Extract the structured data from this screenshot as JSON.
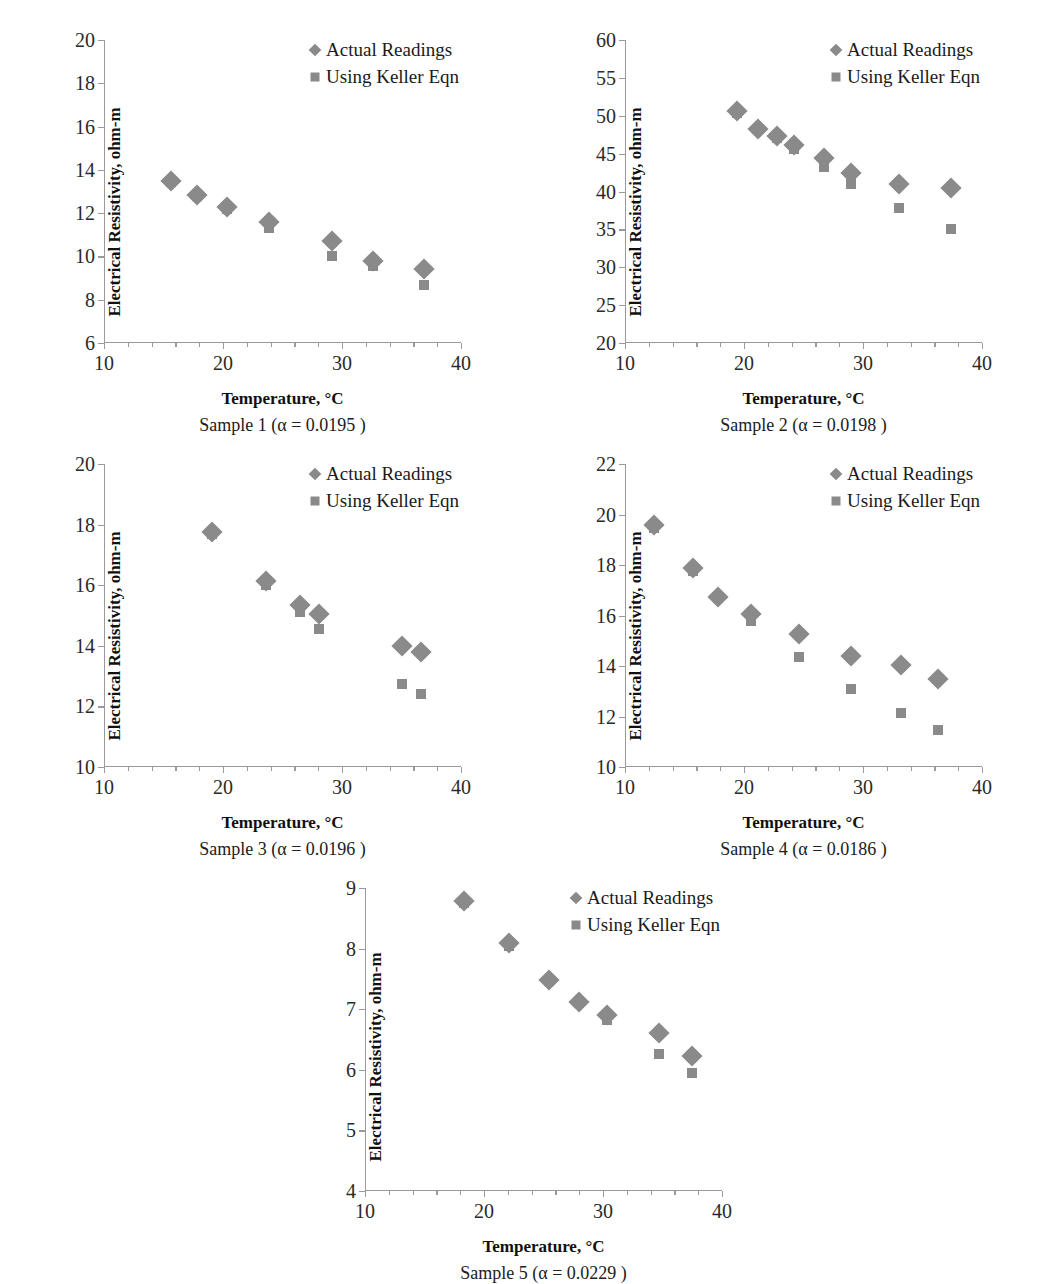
{
  "figure": {
    "layout": "2x2 grid plus one centered bottom panel",
    "marker_color": "#8a8a8a",
    "axis_color": "#9a9a9a",
    "background": "#ffffff"
  },
  "legend": {
    "position": "top-right inside plot",
    "entries": [
      {
        "label": "Actual Readings",
        "marker": "diamond"
      },
      {
        "label": "Using Keller Eqn",
        "marker": "square"
      }
    ]
  },
  "axis_titles": {
    "x": "Temperature, °C",
    "y": "Electrical Resistivity, ohm-m"
  },
  "chart_data": [
    {
      "id": "sample-1",
      "type": "scatter",
      "title": "",
      "caption": "Sample 1 (α = 0.0195 )",
      "alpha": "0.0195",
      "xlabel": "Temperature, °C",
      "ylabel": "Electrical Resistivity, ohm-m",
      "xlim": [
        10,
        40
      ],
      "ylim": [
        6,
        20
      ],
      "xticks": [
        10,
        20,
        30,
        40
      ],
      "yticks": [
        6,
        8,
        10,
        12,
        14,
        16,
        18,
        20
      ],
      "grid": false,
      "series": [
        {
          "name": "Actual Readings",
          "marker": "diamond",
          "points": [
            [
              15.6,
              13.5
            ],
            [
              17.8,
              12.85
            ],
            [
              20.3,
              12.3
            ],
            [
              23.9,
              11.6
            ],
            [
              29.2,
              10.7
            ],
            [
              32.6,
              9.8
            ],
            [
              36.9,
              9.4
            ]
          ]
        },
        {
          "name": "Using Keller Eqn",
          "marker": "square",
          "points": [
            [
              15.6,
              13.45
            ],
            [
              17.8,
              12.8
            ],
            [
              20.3,
              12.2
            ],
            [
              23.9,
              11.3
            ],
            [
              29.2,
              10.0
            ],
            [
              32.6,
              9.55
            ],
            [
              36.9,
              8.7
            ]
          ]
        }
      ]
    },
    {
      "id": "sample-2",
      "type": "scatter",
      "title": "",
      "caption": "Sample 2 (α = 0.0198 )",
      "alpha": "0.0198",
      "xlabel": "Temperature, °C",
      "ylabel": "Electrical Resistivity, ohm-m",
      "xlim": [
        10,
        40
      ],
      "ylim": [
        20,
        60
      ],
      "xticks": [
        10,
        20,
        30,
        40
      ],
      "yticks": [
        20,
        25,
        30,
        35,
        40,
        45,
        50,
        55,
        60
      ],
      "grid": false,
      "series": [
        {
          "name": "Actual Readings",
          "marker": "diamond",
          "points": [
            [
              19.4,
              50.6
            ],
            [
              21.2,
              48.3
            ],
            [
              22.8,
              47.3
            ],
            [
              24.2,
              46.1
            ],
            [
              26.7,
              44.4
            ],
            [
              29.0,
              42.5
            ],
            [
              33.0,
              41.0
            ],
            [
              37.4,
              40.4
            ]
          ]
        },
        {
          "name": "Using Keller Eqn",
          "marker": "square",
          "points": [
            [
              19.4,
              50.3
            ],
            [
              21.2,
              48.2
            ],
            [
              22.8,
              47.0
            ],
            [
              24.2,
              45.6
            ],
            [
              26.7,
              43.3
            ],
            [
              29.0,
              41.0
            ],
            [
              33.0,
              37.8
            ],
            [
              37.4,
              35.0
            ]
          ]
        }
      ]
    },
    {
      "id": "sample-3",
      "type": "scatter",
      "title": "",
      "caption": "Sample 3 (α = 0.0196 )",
      "alpha": "0.0196",
      "xlabel": "Temperature, °C",
      "ylabel": "Electrical Resistivity, ohm-m",
      "xlim": [
        10,
        40
      ],
      "ylim": [
        10,
        20
      ],
      "xticks": [
        10,
        20,
        30,
        40
      ],
      "yticks": [
        10,
        12,
        14,
        16,
        18,
        20
      ],
      "grid": false,
      "series": [
        {
          "name": "Actual Readings",
          "marker": "diamond",
          "points": [
            [
              19.1,
              17.75
            ],
            [
              23.6,
              16.15
            ],
            [
              26.5,
              15.35
            ],
            [
              28.1,
              15.05
            ],
            [
              35.0,
              14.0
            ],
            [
              36.6,
              13.8
            ]
          ]
        },
        {
          "name": "Using Keller Eqn",
          "marker": "square",
          "points": [
            [
              19.1,
              17.7
            ],
            [
              23.6,
              16.0
            ],
            [
              26.5,
              15.1
            ],
            [
              28.1,
              14.55
            ],
            [
              35.0,
              12.75
            ],
            [
              36.6,
              12.4
            ]
          ]
        }
      ]
    },
    {
      "id": "sample-4",
      "type": "scatter",
      "title": "",
      "caption": "Sample 4 (α = 0.0186 )",
      "alpha": "0.0186",
      "xlabel": "Temperature, °C",
      "ylabel": "Electrical Resistivity, ohm-m",
      "xlim": [
        10,
        40
      ],
      "ylim": [
        10,
        22
      ],
      "xticks": [
        10,
        20,
        30,
        40
      ],
      "yticks": [
        10,
        12,
        14,
        16,
        18,
        20,
        22
      ],
      "grid": false,
      "series": [
        {
          "name": "Actual Readings",
          "marker": "diamond",
          "points": [
            [
              12.4,
              19.6
            ],
            [
              15.7,
              17.9
            ],
            [
              17.8,
              16.75
            ],
            [
              20.6,
              16.05
            ],
            [
              24.6,
              15.25
            ],
            [
              29.0,
              14.4
            ],
            [
              33.2,
              14.05
            ],
            [
              36.3,
              13.5
            ]
          ]
        },
        {
          "name": "Using Keller Eqn",
          "marker": "square",
          "points": [
            [
              12.4,
              19.45
            ],
            [
              15.7,
              17.75
            ],
            [
              17.8,
              16.7
            ],
            [
              20.6,
              15.8
            ],
            [
              24.6,
              14.35
            ],
            [
              29.0,
              13.1
            ],
            [
              33.2,
              12.15
            ],
            [
              36.3,
              11.45
            ]
          ]
        }
      ]
    },
    {
      "id": "sample-5",
      "type": "scatter",
      "title": "",
      "caption": "Sample 5 (α = 0.0229 )",
      "alpha": "0.0229",
      "xlabel": "Temperature, °C",
      "ylabel": "Electrical Resistivity, ohm-m",
      "xlim": [
        10,
        40
      ],
      "ylim": [
        4,
        9
      ],
      "xticks": [
        10,
        20,
        30,
        40
      ],
      "yticks": [
        4,
        5,
        6,
        7,
        8,
        9
      ],
      "grid": false,
      "series": [
        {
          "name": "Actual Readings",
          "marker": "diamond",
          "points": [
            [
              18.3,
              8.78
            ],
            [
              22.1,
              8.1
            ],
            [
              25.5,
              7.48
            ],
            [
              28.0,
              7.12
            ],
            [
              30.3,
              6.9
            ],
            [
              34.7,
              6.6
            ],
            [
              37.5,
              6.22
            ]
          ]
        },
        {
          "name": "Using Keller Eqn",
          "marker": "square",
          "points": [
            [
              18.3,
              8.76
            ],
            [
              22.1,
              8.05
            ],
            [
              25.5,
              7.46
            ],
            [
              28.0,
              7.1
            ],
            [
              30.3,
              6.82
            ],
            [
              34.7,
              6.26
            ],
            [
              37.5,
              5.94
            ]
          ]
        }
      ]
    }
  ]
}
